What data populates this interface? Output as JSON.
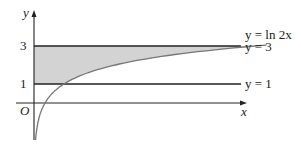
{
  "chart_data": {
    "type": "line",
    "title": "",
    "xlabel": "x",
    "ylabel": "y",
    "origin_label": "O",
    "y_ticks": [
      "1",
      "3"
    ],
    "series": [
      {
        "name": "y = ln 2x",
        "function": "ln(2x)"
      },
      {
        "name": "y = 3",
        "value": 3
      },
      {
        "name": "y = 1",
        "value": 1
      }
    ],
    "shaded_region": "between y=1, y=3, the y-axis and the curve y = ln 2x"
  },
  "labels": {
    "curve": "y = ln 2x",
    "line3": "y = 3",
    "line1": "y = 1",
    "x_axis": "x",
    "y_axis": "y",
    "origin": "O",
    "tick1": "1",
    "tick3": "3"
  },
  "colors": {
    "shade": "#d3d3d3",
    "curve": "#777777",
    "line": "#222222"
  }
}
